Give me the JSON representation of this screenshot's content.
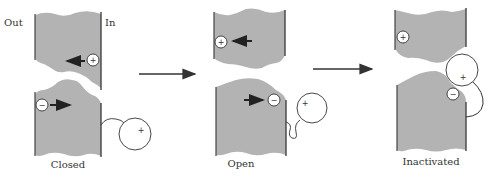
{
  "diagram": {
    "labels": {
      "out": "Out",
      "in": "In"
    },
    "colors": {
      "membrane": "#b3b3b3",
      "edge": "#444444",
      "arrow": "#222222",
      "background": "#ffffff"
    },
    "states": [
      {
        "id": "closed",
        "caption": "Closed",
        "gate_charge_top": "+",
        "gate_charge_bottom": "−",
        "ball_charge": "+"
      },
      {
        "id": "open",
        "caption": "Open",
        "gate_charge_top": "+",
        "gate_charge_bottom": "−",
        "ball_charge": "+"
      },
      {
        "id": "inactivated",
        "caption": "Inactivated",
        "gate_charge_top": "+",
        "gate_charge_bottom": "−",
        "ball_charge": "+"
      }
    ],
    "transitions": [
      {
        "from": "closed",
        "to": "open",
        "icon": "arrow-right-icon"
      },
      {
        "from": "open",
        "to": "inactivated",
        "icon": "arrow-right-icon"
      }
    ]
  }
}
